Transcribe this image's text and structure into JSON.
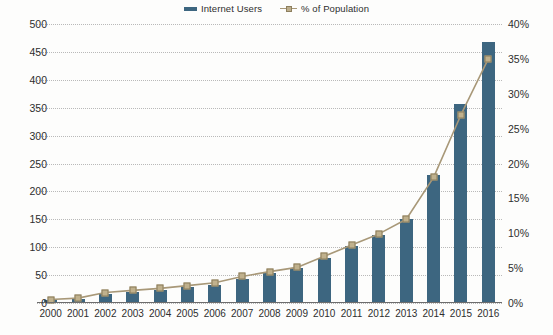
{
  "legend": {
    "position": "top-center",
    "items": [
      {
        "label": "Internet Users",
        "marker": "bar-swatch-icon",
        "color": "#3d6680"
      },
      {
        "label": "% of Population",
        "marker": "line-square-marker-icon",
        "color": "#a89878"
      }
    ]
  },
  "colors": {
    "bar": "#3d6680",
    "line": "#a89878",
    "marker_fill": "#c0b18d",
    "marker_stroke": "#8a7c5b",
    "gridline": "#b9b9b9",
    "axis": "#6d6d6d",
    "text": "#2e2e2e",
    "background": "#fdfdfc"
  },
  "chart_data": {
    "type": "bar",
    "title": "",
    "subtitle": "",
    "xlabel": "",
    "ylabel": "",
    "y2label": "",
    "grid": true,
    "legend_position": "top-center",
    "categories": [
      "2000",
      "2001",
      "2002",
      "2003",
      "2004",
      "2005",
      "2006",
      "2007",
      "2008",
      "2009",
      "2010",
      "2011",
      "2012",
      "2013",
      "2014",
      "2015",
      "2016"
    ],
    "ylim": [
      0,
      500
    ],
    "yticks": [
      0,
      50,
      100,
      150,
      200,
      250,
      300,
      350,
      400,
      450,
      500
    ],
    "ytick_labels": [
      "0",
      "50",
      "100",
      "150",
      "200",
      "250",
      "300",
      "350",
      "400",
      "450",
      "500"
    ],
    "y2lim": [
      0,
      40
    ],
    "y2ticks": [
      0,
      5,
      10,
      15,
      20,
      25,
      30,
      35,
      40
    ],
    "y2tick_labels": [
      "0%",
      "5%",
      "10%",
      "15%",
      "20%",
      "25%",
      "30%",
      "35%",
      "40%"
    ],
    "series": [
      {
        "name": "Internet Users",
        "kind": "bar",
        "axis": "left",
        "unit": "millions",
        "color": "#3d6680",
        "values": [
          5,
          7,
          16,
          19,
          23,
          28,
          33,
          43,
          53,
          62,
          81,
          102,
          122,
          151,
          230,
          356,
          467
        ]
      },
      {
        "name": "% of Population",
        "kind": "line",
        "axis": "right",
        "unit": "percent",
        "color": "#a89878",
        "values": [
          0.5,
          0.7,
          1.5,
          1.8,
          2.1,
          2.5,
          2.9,
          3.8,
          4.5,
          5.1,
          6.7,
          8.3,
          9.9,
          12.0,
          18.0,
          27.0,
          35.0
        ]
      }
    ]
  }
}
